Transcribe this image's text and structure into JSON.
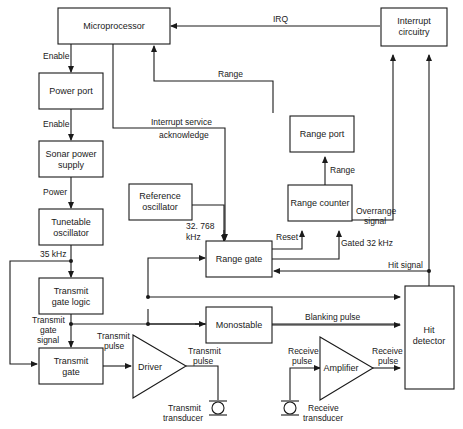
{
  "diagram": {
    "blocks": {
      "microprocessor": "Microprocessor",
      "interrupt_circuitry": [
        "Interrupt",
        "circuitry"
      ],
      "power_port": "Power port",
      "sonar_power_supply": [
        "Sonar power",
        "supply"
      ],
      "tunetable_oscillator": [
        "Tunetable",
        "oscillator"
      ],
      "transmit_gate_logic": [
        "Transmit",
        "gate logic"
      ],
      "transmit_gate": [
        "Transmit",
        "gate"
      ],
      "driver": "Driver",
      "reference_oscillator": [
        "Reference",
        "oscillator"
      ],
      "range_gate": "Range gate",
      "range_port": "Range port",
      "range_counter": "Range counter",
      "monostable": "Monostable",
      "amplifier": "Amplifier",
      "hit_detector": [
        "Hit",
        "detector"
      ]
    },
    "signals": {
      "irq": "IRQ",
      "range_top": "Range",
      "enable1": "Enable",
      "enable2": "Enable",
      "power": "Power",
      "khz35": "35 kHz",
      "isa": [
        "Interrupt service",
        "acknowledge"
      ],
      "range_mid": "Range",
      "overrange": [
        "Overrange",
        "signal"
      ],
      "ref_freq": [
        "32. 768",
        "kHz"
      ],
      "reset": "Reset",
      "gated": "Gated 32 kHz",
      "hit_signal": "Hit signal",
      "tg_signal": [
        "Transmit",
        "gate",
        "signal"
      ],
      "tx_pulse1": [
        "Transmit",
        "pulse"
      ],
      "tx_pulse2": [
        "Transmit",
        "pulse"
      ],
      "blanking": "Blanking pulse",
      "rx_pulse1": [
        "Receive",
        "pulse"
      ],
      "rx_pulse2": [
        "Receive",
        "pulse"
      ],
      "tx_transducer": [
        "Transmit",
        "transducer"
      ],
      "rx_transducer": [
        "Receive",
        "transducer"
      ]
    }
  }
}
